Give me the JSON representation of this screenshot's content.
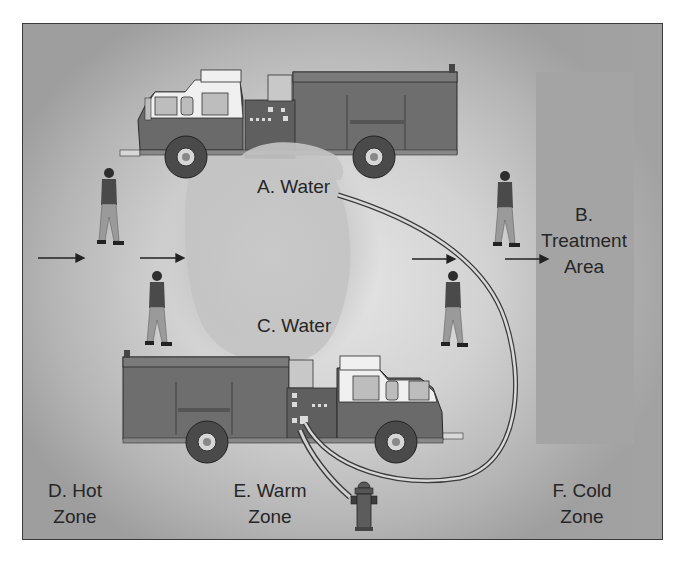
{
  "diagram": {
    "type": "incident scene zone layout",
    "labels": {
      "a": "A. Water",
      "b_line1": "B.",
      "b_line2": "Treatment",
      "b_line3": "Area",
      "c": "C. Water",
      "d_line1": "D. Hot",
      "d_line2": "Zone",
      "e_line1": "E. Warm",
      "e_line2": "Zone",
      "f_line1": "F. Cold",
      "f_line2": "Zone"
    },
    "elements": {
      "trucks": [
        "fire-engine-top (facing left)",
        "fire-engine-bottom (facing right)"
      ],
      "people_count": 4,
      "arrows_count": 4,
      "hydrant": "fire-hydrant connected to bottom engine",
      "hose": "hose from bottom engine pump panel looping to water spray A"
    },
    "colors": {
      "frame_border": "#3a3a3a",
      "background_light": "#e6e6e6",
      "background_dark": "#9e9e9e",
      "treatment_area": "#a4a4a4",
      "truck_body": "#6e6e6e",
      "truck_cab_white": "#f2f2f2",
      "text": "#262626"
    }
  }
}
